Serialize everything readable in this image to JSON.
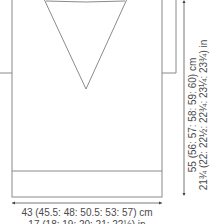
{
  "diagram": {
    "type": "knitting schematic",
    "height_dimension": {
      "cm": "55 (56: 57: 58: 59: 60) cm",
      "in": "21¾ (22: 22½: 22¾: 23¼: 23¾) in"
    },
    "width_dimension": {
      "cm": "43 (45.5: 48: 50.5: 53: 57) cm",
      "in": "17 (18: 19: 20: 21: 22½) in"
    },
    "colors": {
      "outline": "#8a8a8a",
      "text": "#4a4a4a",
      "dimension_line": "#555555"
    }
  }
}
